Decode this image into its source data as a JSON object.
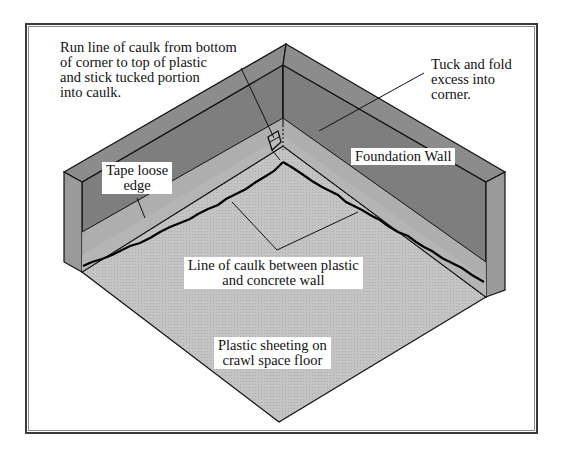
{
  "diagram": {
    "title": "",
    "colors": {
      "wall_top": "#8c8c8c",
      "wall_face": "#7e7e7e",
      "wall_end": "#9a9a9a",
      "plastic_strip": "#b8b8b8",
      "floor": "#c4c4c4",
      "line": "#111111",
      "frame": "#3a3a3a"
    },
    "labels": {
      "caulk_corner": [
        "Run line of caulk from bottom",
        "of corner to top of plastic",
        "and stick tucked portion",
        "into caulk."
      ],
      "tuck_fold": [
        "Tuck and fold",
        "excess into",
        "corner."
      ],
      "tape_edge": [
        "Tape loose",
        "edge"
      ],
      "foundation_wall": "Foundation Wall",
      "caulk_line": [
        "Line of caulk between plastic",
        "and concrete wall"
      ],
      "plastic_floor": [
        "Plastic sheeting on",
        "crawl space floor"
      ]
    }
  }
}
